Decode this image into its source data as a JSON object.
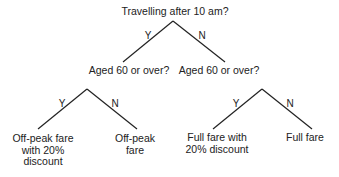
{
  "diagram": {
    "type": "decision-tree",
    "line_color": "#222222",
    "root": {
      "question": "Travelling after 10 am?"
    },
    "level1": {
      "yes_branch_label": "Y",
      "no_branch_label": "N",
      "left_node": "Aged 60 or over?",
      "right_node": "Aged 60 or over?"
    },
    "level2_left": {
      "yes_branch_label": "Y",
      "no_branch_label": "N",
      "yes_outcome": [
        "Off-peak fare",
        "with 20%",
        "discount"
      ],
      "no_outcome": [
        "Off-peak",
        "fare"
      ]
    },
    "level2_right": {
      "yes_branch_label": "Y",
      "no_branch_label": "N",
      "yes_outcome": [
        "Full fare with",
        "20% discount"
      ],
      "no_outcome": [
        "Full fare"
      ]
    }
  }
}
